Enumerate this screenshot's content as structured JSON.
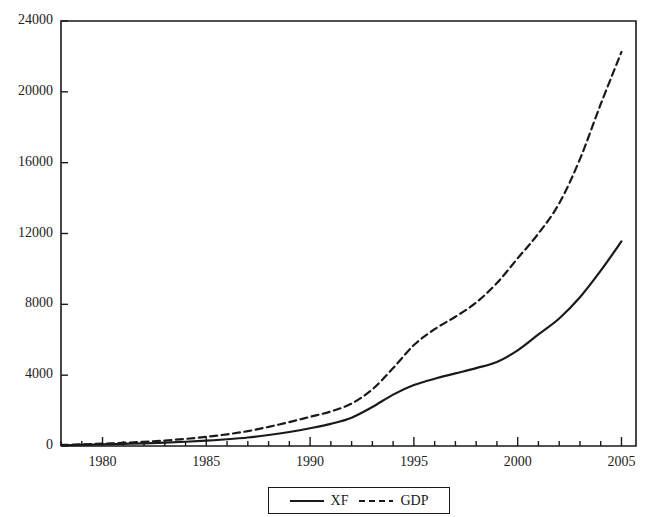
{
  "chart_data": {
    "type": "line",
    "title": "",
    "xlabel": "",
    "ylabel": "",
    "xlim": [
      1978,
      2005.7
    ],
    "ylim": [
      0,
      24000
    ],
    "grid": false,
    "legend_position": "bottom-center",
    "x_ticks_major": [
      1980,
      1985,
      1990,
      1995,
      2000,
      2005
    ],
    "x_tick_labels": [
      "1980",
      "1985",
      "1990",
      "1995",
      "2000",
      "2005"
    ],
    "x_minor_tick_interval": 1,
    "y_ticks": [
      0,
      4000,
      8000,
      12000,
      16000,
      20000,
      24000
    ],
    "y_tick_labels": [
      "0",
      "4000",
      "8000",
      "12000",
      "16000",
      "20000",
      "24000"
    ],
    "x": [
      1978,
      1979,
      1980,
      1981,
      1982,
      1983,
      1984,
      1985,
      1986,
      1987,
      1988,
      1989,
      1990,
      1991,
      1992,
      1993,
      1994,
      1995,
      1996,
      1997,
      1998,
      1999,
      2000,
      2001,
      2002,
      2003,
      2004,
      2005
    ],
    "series": [
      {
        "name": "XF",
        "style": "solid",
        "color": "#1a1a1a",
        "values": [
          40,
          60,
          90,
          120,
          150,
          190,
          240,
          300,
          380,
          480,
          620,
          790,
          1000,
          1250,
          1600,
          2200,
          2900,
          3440,
          3800,
          4100,
          4400,
          4750,
          5400,
          6300,
          7200,
          8400,
          9900,
          11550
        ]
      },
      {
        "name": "GDP",
        "style": "dashed",
        "color": "#1a1a1a",
        "values": [
          60,
          90,
          130,
          180,
          240,
          310,
          400,
          520,
          660,
          840,
          1080,
          1350,
          1650,
          1950,
          2400,
          3200,
          4400,
          5700,
          6600,
          7300,
          8100,
          9200,
          10600,
          12000,
          13700,
          16200,
          19300,
          22250
        ]
      }
    ]
  },
  "legend": {
    "items": [
      {
        "label": "XF",
        "style": "solid"
      },
      {
        "label": "GDP",
        "style": "dashed"
      }
    ]
  }
}
